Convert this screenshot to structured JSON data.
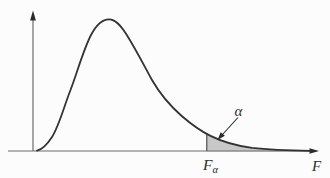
{
  "figure": {
    "labels": {
      "alpha": "α",
      "critical_value_base": "F",
      "critical_value_sub": "α",
      "axis": "F"
    },
    "colors": {
      "curve": "#333333",
      "axis": "#6b6b6b",
      "arrow": "#2a2a2a",
      "shade": "#c8c8c8",
      "background": "#fcfcfc",
      "text": "#2e2e2e"
    }
  }
}
